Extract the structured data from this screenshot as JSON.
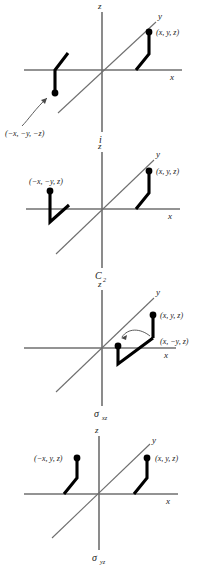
{
  "figure": {
    "colors": {
      "axis": "#6f6f6f",
      "arm": "#000000",
      "dot": "#000000",
      "text": "#1a1a1a",
      "arrow": "#4a4a4a",
      "background": "#ffffff"
    },
    "axis_labels": {
      "x": "x",
      "y": "y",
      "z": "z"
    }
  },
  "panels": [
    {
      "id": "inversion",
      "operation_label": "i",
      "operation_subscript": "",
      "operation_name": "inversion-center",
      "points": [
        {
          "name": "original-point",
          "label": "(x, y, z)",
          "position": "upper-right"
        },
        {
          "name": "transformed-point",
          "label": "(−x, −y, −z)",
          "position": "lower-left"
        }
      ],
      "has_arrow": true,
      "arrow_from": "label",
      "arrow_to": "transformed-point"
    },
    {
      "id": "c2-rotation",
      "operation_label": "C",
      "operation_subscript": "2",
      "operation_name": "two-fold-rotation-axis",
      "points": [
        {
          "name": "original-point",
          "label": "(x, y, z)",
          "position": "upper-right"
        },
        {
          "name": "transformed-point",
          "label": "(−x, −y, z)",
          "position": "upper-left"
        }
      ],
      "has_arrow": false,
      "arrow_from": "",
      "arrow_to": ""
    },
    {
      "id": "sigma-xz",
      "operation_label": "σ",
      "operation_subscript": "xz",
      "operation_name": "mirror-plane-xz",
      "points": [
        {
          "name": "original-point",
          "label": "(x, y, z)",
          "position": "upper-right"
        },
        {
          "name": "transformed-point",
          "label": "(x, −y, z)",
          "position": "right-middle"
        }
      ],
      "has_arrow": true,
      "arrow_from": "original-arm",
      "arrow_to": "transformed-point"
    },
    {
      "id": "sigma-yz",
      "operation_label": "σ",
      "operation_subscript": "yz",
      "operation_name": "mirror-plane-yz",
      "points": [
        {
          "name": "original-point",
          "label": "(x, y, z)",
          "position": "upper-right"
        },
        {
          "name": "transformed-point",
          "label": "(−x, y, z)",
          "position": "upper-left"
        }
      ],
      "has_arrow": false,
      "arrow_from": "",
      "arrow_to": ""
    }
  ],
  "caption": ""
}
